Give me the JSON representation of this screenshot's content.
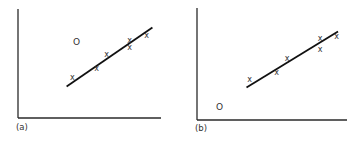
{
  "figure": {
    "point_marker": "x",
    "outlier_marker": "O"
  },
  "chart_data": [
    {
      "type": "scatter",
      "panel_label": "(a)",
      "title": "",
      "xlabel": "",
      "ylabel": "",
      "xlim": [
        0,
        10
      ],
      "ylim": [
        0,
        10
      ],
      "grid": false,
      "points": [
        {
          "x": 3.8,
          "y": 3.7
        },
        {
          "x": 5.5,
          "y": 4.5
        },
        {
          "x": 6.2,
          "y": 5.8
        },
        {
          "x": 7.8,
          "y": 7.1
        },
        {
          "x": 7.8,
          "y": 6.5
        },
        {
          "x": 9.0,
          "y": 7.6
        }
      ],
      "outlier": {
        "x": 4.1,
        "y": 7.0
      },
      "fit_line": {
        "x0": 3.4,
        "y0": 2.9,
        "x1": 9.4,
        "y1": 8.3
      },
      "line_color": "#111111"
    },
    {
      "type": "scatter",
      "panel_label": "(b)",
      "title": "",
      "xlabel": "",
      "ylabel": "",
      "xlim": [
        0,
        10
      ],
      "ylim": [
        0,
        10
      ],
      "grid": false,
      "points": [
        {
          "x": 3.5,
          "y": 3.6
        },
        {
          "x": 5.3,
          "y": 4.2
        },
        {
          "x": 6.0,
          "y": 5.5
        },
        {
          "x": 8.2,
          "y": 7.3
        },
        {
          "x": 8.2,
          "y": 6.3
        },
        {
          "x": 9.3,
          "y": 7.5
        }
      ],
      "outlier": {
        "x": 1.5,
        "y": 1.2
      },
      "fit_line": {
        "x0": 3.3,
        "y0": 2.9,
        "x1": 9.4,
        "y1": 7.9
      },
      "line_color": "#111111"
    }
  ]
}
